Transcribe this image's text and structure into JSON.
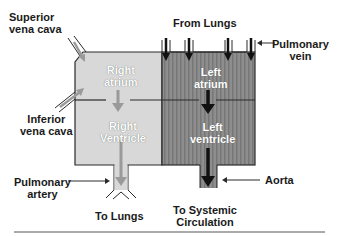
{
  "diagram": {
    "type": "heart-blood-flow-schematic",
    "colors": {
      "right_side_fill": "#d6d6d6",
      "left_side_fill": "#8c8c8c",
      "right_arrow": "#9a9a9a",
      "left_arrow": "#111111",
      "outline": "#2a2a2a"
    },
    "labels": {
      "superior_vena_cava": [
        "Superior",
        "vena cava"
      ],
      "inferior_vena_cava": [
        "Inferior",
        "vena cava"
      ],
      "right_atrium": [
        "Right",
        "atrium"
      ],
      "right_ventricle": [
        "Right",
        "Ventricle"
      ],
      "pulmonary_artery": [
        "Pulmonary",
        "artery"
      ],
      "to_lungs": "To Lungs",
      "from_lungs": "From Lungs",
      "pulmonary_vein": [
        "Pulmonary",
        "vein"
      ],
      "left_atrium": [
        "Left",
        "atrium"
      ],
      "left_ventricle": [
        "Left",
        "ventricle"
      ],
      "aorta": "Aorta",
      "to_systemic": [
        "To Systemic",
        "Circulation"
      ]
    }
  }
}
